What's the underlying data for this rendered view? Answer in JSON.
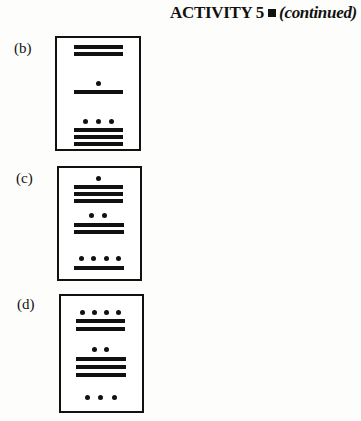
{
  "header": {
    "title": "ACTIVITY 5",
    "subtitle": "(continued)"
  },
  "problems": [
    {
      "label": "(b)",
      "levels": [
        {
          "bars": 2,
          "dots": 0
        },
        {
          "bars": 1,
          "dots": 1
        },
        {
          "bars": 3,
          "dots": 3
        }
      ]
    },
    {
      "label": "(c)",
      "levels": [
        {
          "bars": 3,
          "dots": 1
        },
        {
          "bars": 2,
          "dots": 2
        },
        {
          "bars": 1,
          "dots": 4
        }
      ]
    },
    {
      "label": "(d)",
      "levels": [
        {
          "bars": 2,
          "dots": 4
        },
        {
          "bars": 3,
          "dots": 2
        },
        {
          "bars": 0,
          "dots": 3
        }
      ]
    }
  ]
}
